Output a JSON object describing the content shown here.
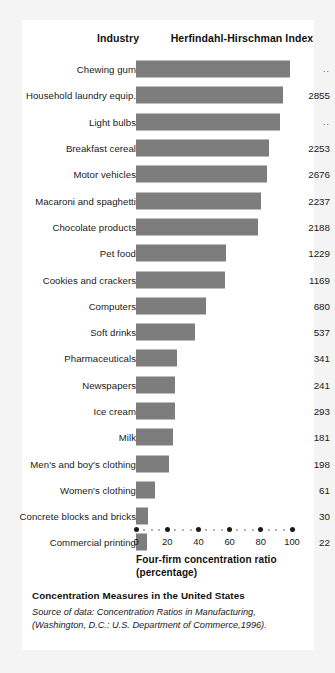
{
  "headers": {
    "industry": "Industry",
    "hhi": "Herfindahl-Hirschman Index"
  },
  "footer": {
    "title": "Concentration Measures in the United States",
    "source": "Source of data: Concentration Ratios in Manufacturing, (Washington, D.C.: U.S. Department of Commerce,1996)."
  },
  "axis": {
    "title_line1": "Four-firm concentration ratio",
    "title_line2": "(percentage)"
  },
  "colors": {
    "bar": "#7d7d7d",
    "card": "#ffffff",
    "page": "#f4f4f4",
    "text": "#1a1a1a"
  },
  "chart_data": {
    "type": "bar",
    "title": "Concentration Measures in the United States",
    "xlabel": "Four-firm concentration ratio (percentage)",
    "ylabel": "Industry",
    "xlim": [
      0,
      100
    ],
    "grid": false,
    "orientation": "horizontal",
    "legend": "none",
    "tick_labels": [
      "0",
      "20",
      "40",
      "60",
      "80",
      "100"
    ],
    "ticks": [
      0,
      20,
      40,
      60,
      80,
      100
    ],
    "value_column_header": "Herfindahl-Hirschman Index",
    "categories": [
      "Chewing gum",
      "Household laundry equip.",
      "Light bulbs",
      "Breakfast cereal",
      "Motor vehicles",
      "Macaroni and spaghetti",
      "Chocolate products",
      "Pet food",
      "Cookies and crackers",
      "Computers",
      "Soft drinks",
      "Pharmaceuticals",
      "Newspapers",
      "Ice cream",
      "Milk",
      "Men's and boy's clothing",
      "Women's clothing",
      "Concrete blocks and bricks",
      "Commercial printing"
    ],
    "values": [
      99,
      94,
      92,
      85,
      84,
      80,
      78,
      58,
      57,
      45,
      38,
      26,
      25,
      25,
      24,
      21,
      12,
      8,
      7
    ],
    "hhi": [
      "..",
      "2855",
      "..",
      "2253",
      "2676",
      "2237",
      "2188",
      "1229",
      "1169",
      "680",
      "537",
      "341",
      "241",
      "293",
      "181",
      "198",
      "61",
      "30",
      "22"
    ],
    "rows": [
      {
        "industry": "Chewing gum",
        "ratio": 99,
        "hhi": ".."
      },
      {
        "industry": "Household laundry equip.",
        "ratio": 94,
        "hhi": "2855"
      },
      {
        "industry": "Light bulbs",
        "ratio": 92,
        "hhi": ".."
      },
      {
        "industry": "Breakfast cereal",
        "ratio": 85,
        "hhi": "2253"
      },
      {
        "industry": "Motor vehicles",
        "ratio": 84,
        "hhi": "2676"
      },
      {
        "industry": "Macaroni and spaghetti",
        "ratio": 80,
        "hhi": "2237"
      },
      {
        "industry": "Chocolate products",
        "ratio": 78,
        "hhi": "2188"
      },
      {
        "industry": "Pet food",
        "ratio": 58,
        "hhi": "1229"
      },
      {
        "industry": "Cookies and crackers",
        "ratio": 57,
        "hhi": "1169"
      },
      {
        "industry": "Computers",
        "ratio": 45,
        "hhi": "680"
      },
      {
        "industry": "Soft drinks",
        "ratio": 38,
        "hhi": "537"
      },
      {
        "industry": "Pharmaceuticals",
        "ratio": 26,
        "hhi": "341"
      },
      {
        "industry": "Newspapers",
        "ratio": 25,
        "hhi": "241"
      },
      {
        "industry": "Ice cream",
        "ratio": 25,
        "hhi": "293"
      },
      {
        "industry": "Milk",
        "ratio": 24,
        "hhi": "181"
      },
      {
        "industry": "Men's and boy's clothing",
        "ratio": 21,
        "hhi": "198"
      },
      {
        "industry": "Women's clothing",
        "ratio": 12,
        "hhi": "61"
      },
      {
        "industry": "Concrete blocks and bricks",
        "ratio": 8,
        "hhi": "30"
      },
      {
        "industry": "Commercial printing",
        "ratio": 7,
        "hhi": "22"
      }
    ]
  }
}
